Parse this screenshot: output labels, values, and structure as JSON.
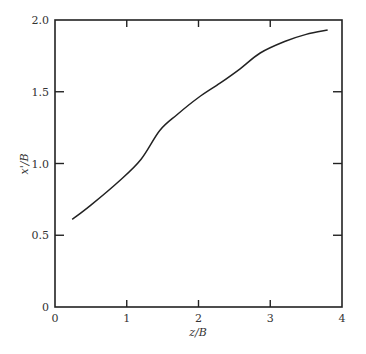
{
  "chart_data": {
    "type": "line",
    "title": "",
    "xlabel": "z/B",
    "ylabel": "x'/B",
    "xlim": [
      0,
      4
    ],
    "ylim": [
      0,
      2.0
    ],
    "xticks": [
      "0",
      "1",
      "2",
      "3",
      "4"
    ],
    "yticks": [
      "0",
      "0.5",
      "1.0",
      "1.5",
      "2.0"
    ],
    "grid": false,
    "legend": null,
    "series": [
      {
        "name": "x'/B vs z/B",
        "x": [
          0.24,
          0.5,
          0.9,
          1.2,
          1.46,
          1.7,
          2.0,
          2.3,
          2.58,
          2.86,
          3.2,
          3.5,
          3.8
        ],
        "y": [
          0.61,
          0.71,
          0.88,
          1.03,
          1.23,
          1.34,
          1.46,
          1.56,
          1.66,
          1.77,
          1.85,
          1.9,
          1.93
        ]
      }
    ]
  }
}
